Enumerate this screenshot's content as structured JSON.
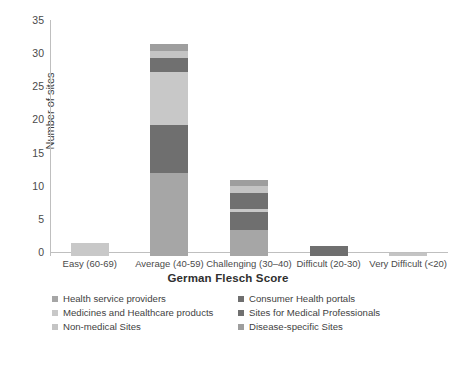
{
  "chart_data": {
    "type": "bar",
    "stacked": true,
    "title": "",
    "xlabel": "German Flesch Score",
    "ylabel": "Number of sites",
    "categories": [
      "Easy (60-69)",
      "Average (40-59)",
      "Challenging (30–40)",
      "Difficult (20-30)",
      "Very Difficult (<20)"
    ],
    "ylim": [
      0,
      35
    ],
    "yticks": [
      0,
      5,
      10,
      15,
      20,
      25,
      30,
      35
    ],
    "grid": false,
    "legend_position": "bottom",
    "series": [
      {
        "name": "Health service providers",
        "color": "#a6a6a6",
        "values": [
          0,
          12.5,
          4,
          0,
          0
        ]
      },
      {
        "name": "Consumer Health portals",
        "color": "#6f6f6f",
        "values": [
          0,
          7.2,
          2.6,
          1.5,
          0
        ]
      },
      {
        "name": "Medicines and Healthcare products",
        "color": "#c8c8c8",
        "values": [
          2,
          8.1,
          0.5,
          0,
          0
        ]
      },
      {
        "name": "Sites for Medical Professionals",
        "color": "#707070",
        "values": [
          0,
          2.1,
          2.4,
          0,
          0
        ]
      },
      {
        "name": "Non-medical Sites",
        "color": "#c4c4c4",
        "values": [
          0,
          1.1,
          1.0,
          0,
          0.5
        ]
      },
      {
        "name": "Disease-specific Sites",
        "color": "#9e9e9e",
        "values": [
          0,
          1.0,
          1.0,
          0,
          0
        ]
      }
    ],
    "totals": [
      2,
      32,
      11.5,
      1.5,
      0.5
    ]
  },
  "axis": {
    "y_title": "Number of sites",
    "x_title": "German Flesch Score",
    "y_ticks": [
      "0",
      "5",
      "10",
      "15",
      "20",
      "25",
      "30",
      "35"
    ]
  },
  "legend": {
    "items": [
      {
        "label": "Health service providers",
        "color": "#a6a6a6"
      },
      {
        "label": "Consumer Health portals",
        "color": "#6f6f6f"
      },
      {
        "label": "Medicines and Healthcare products",
        "color": "#c8c8c8"
      },
      {
        "label": "Sites for Medical Professionals",
        "color": "#707070"
      },
      {
        "label": "Non-medical Sites",
        "color": "#c4c4c4"
      },
      {
        "label": "Disease-specific Sites",
        "color": "#9e9e9e"
      }
    ]
  },
  "caption": {
    "text": ""
  }
}
